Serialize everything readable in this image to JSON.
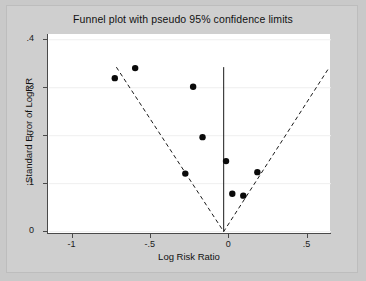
{
  "chart_data": {
    "type": "scatter",
    "title": "Funnel plot with pseudo 95% confidence limits",
    "xlabel": "Log Risk Ratio",
    "ylabel": "Standard Error of LogRR",
    "xlim": [
      -1.15,
      0.65
    ],
    "ylim": [
      0.41,
      -0.005
    ],
    "y_inverted": true,
    "grid": "horizontal",
    "legend": "none",
    "xticks": [
      -1,
      -0.5,
      0,
      0.5
    ],
    "xtick_labels": [
      "-1",
      "-.5",
      "0",
      ".5"
    ],
    "yticks": [
      0,
      0.1,
      0.2,
      0.3,
      0.4
    ],
    "ytick_labels": [
      "0",
      ".1",
      ".2",
      ".3",
      ".4"
    ],
    "series": [
      {
        "name": "studies",
        "marker": "filled-circle",
        "color": "#0a0a0a",
        "x": [
          -0.73,
          -0.6,
          -0.28,
          -0.23,
          -0.17,
          -0.02,
          0.02,
          0.09,
          0.18
        ],
        "y": [
          0.32,
          0.341,
          0.121,
          0.302,
          0.197,
          0.147,
          0.079,
          0.075,
          0.124
        ]
      }
    ],
    "annotations": [
      {
        "name": "pseudo-95-confidence-limits",
        "type": "funnel-dashed",
        "apex": [
          -0.035,
          0.0
        ],
        "left_end": [
          -0.72,
          0.343
        ],
        "right_end": [
          0.64,
          0.343
        ],
        "style": "dashed"
      },
      {
        "name": "pooled-effect-line",
        "type": "vertical-line",
        "x": -0.035,
        "y_from": 0.0,
        "y_to": 0.343,
        "style": "solid"
      }
    ]
  },
  "figure": {
    "background_color": "#c9c9c9",
    "plot_background_color": "#ffffff",
    "grid_color": "#efefef",
    "axis_color": "#4a4a4a",
    "marker_color": "#0a0a0a"
  }
}
